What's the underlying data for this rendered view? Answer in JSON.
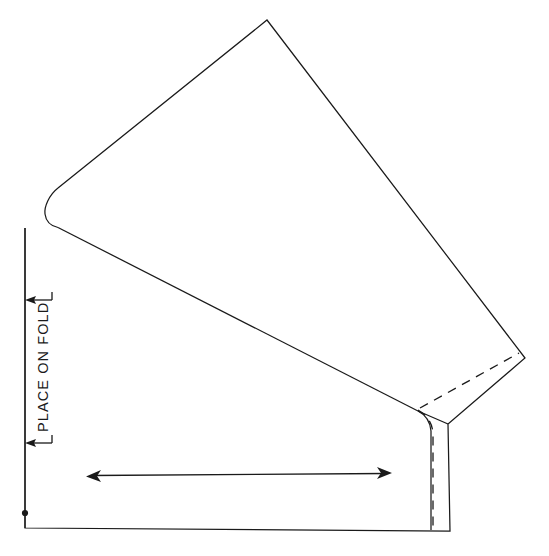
{
  "document": {
    "title": "Sewing Pattern Piece Diagram",
    "type": "technical-line-drawing",
    "background_color": "#ffffff",
    "line_color": "#1a1a1a",
    "canvas": {
      "width": 549,
      "height": 556
    }
  },
  "labels": {
    "place_on_fold": "PLACE ON FOLD"
  },
  "markings": {
    "fold_line_name": "fold-line",
    "grainline_name": "grainline-double-arrow",
    "stitching_line_name": "dashed-stitching-line",
    "notch_dot_name": "notch-dot"
  },
  "geometry": {
    "body_outline": "M 25,228 L 25,528 L 450,531 L 448,424 L 525,358 L 267,20 L 58,188",
    "neckline_curve": "M 58,188 C 49,195 44,207 45,214 C 46,222 51,226 58,227.5",
    "shoulder_seam": "M 58,227.5 L 418,411",
    "sleeve_hem_line": "M 418,411 L 448,424",
    "underarm_curve": "M 418,411 C 424,414 430,420 431,431 L 431,530",
    "dashed_hem_stitch": "M 420,408 L 519,353",
    "dashed_side_stitch": "M 418,410 C 425,414 432,421 433,433 L 433,531",
    "fold_line": "M 25,228 L 25,528",
    "grain_arrow_line": "M 90,475 L 388,474",
    "fold_arrow_top": {
      "x": 25,
      "y": 300,
      "direction": "left"
    },
    "fold_arrow_bottom": {
      "x": 25,
      "y": 443,
      "direction": "left"
    },
    "notch_dot": {
      "cx": 25,
      "cy": 513,
      "r": 3
    },
    "fold_label_position": {
      "x": 46,
      "y": 430,
      "rotation": -90
    }
  }
}
